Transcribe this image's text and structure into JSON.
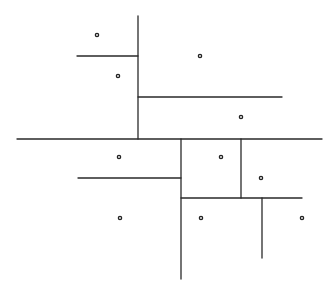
{
  "diagram": {
    "type": "kd-tree-spatial-partition",
    "width": 336,
    "height": 299,
    "line_color": "#2a2a2a",
    "point_color": "#222222",
    "segments": [
      {
        "id": "root-split-horizontal",
        "x1": 17,
        "y1": 139,
        "x2": 322,
        "y2": 139
      },
      {
        "id": "upper-split-vertical",
        "x1": 138,
        "y1": 16,
        "x2": 138,
        "y2": 139
      },
      {
        "id": "upper-left-split-horizontal",
        "x1": 77,
        "y1": 56,
        "x2": 138,
        "y2": 56
      },
      {
        "id": "upper-right-split-horizontal",
        "x1": 138,
        "y1": 97,
        "x2": 282,
        "y2": 97
      },
      {
        "id": "lower-split-vertical",
        "x1": 181,
        "y1": 139,
        "x2": 181,
        "y2": 279
      },
      {
        "id": "lower-left-split-horizontal",
        "x1": 78,
        "y1": 178,
        "x2": 181,
        "y2": 178
      },
      {
        "id": "lower-right-split-horizontal",
        "x1": 181,
        "y1": 198,
        "x2": 302,
        "y2": 198
      },
      {
        "id": "lower-right-top-split-vertical",
        "x1": 241,
        "y1": 139,
        "x2": 241,
        "y2": 198
      },
      {
        "id": "lower-right-bottom-split-vertical",
        "x1": 262,
        "y1": 198,
        "x2": 262,
        "y2": 258
      }
    ],
    "points": [
      {
        "x": 97,
        "y": 35
      },
      {
        "x": 118,
        "y": 76
      },
      {
        "x": 200,
        "y": 56
      },
      {
        "x": 241,
        "y": 117
      },
      {
        "x": 119,
        "y": 157
      },
      {
        "x": 221,
        "y": 157
      },
      {
        "x": 261,
        "y": 178
      },
      {
        "x": 120,
        "y": 218
      },
      {
        "x": 201,
        "y": 218
      },
      {
        "x": 302,
        "y": 218
      }
    ]
  }
}
